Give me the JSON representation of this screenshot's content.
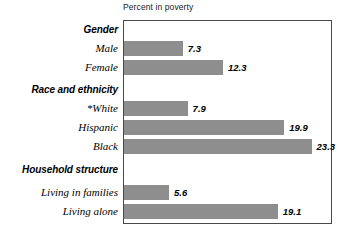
{
  "chart": {
    "title": "Percent in poverty"
  },
  "chart_data": {
    "type": "bar",
    "orientation": "horizontal",
    "title": "Percent in poverty",
    "xlabel": "Percent in poverty",
    "ylabel": "",
    "xlim": [
      0,
      25.7
    ],
    "grid": false,
    "legend": null,
    "bar_color": "#8e8e8e",
    "frame_color": "#4a4a4a",
    "groups": [
      {
        "heading": "Gender",
        "items": [
          {
            "category": "Male",
            "value": 7.3,
            "label": "7.3"
          },
          {
            "category": "Female",
            "value": 12.3,
            "label": "12.3"
          }
        ]
      },
      {
        "heading": "Race and ethnicity",
        "items": [
          {
            "category": "*White",
            "value": 7.9,
            "label": "7.9"
          },
          {
            "category": "Hispanic",
            "value": 19.9,
            "label": "19.9"
          },
          {
            "category": "Black",
            "value": 23.3,
            "label": "23.3"
          }
        ]
      },
      {
        "heading": "Household structure",
        "items": [
          {
            "category": "Living in families",
            "value": 5.6,
            "label": "5.6"
          },
          {
            "category": "Living alone",
            "value": 19.1,
            "label": "19.1"
          }
        ]
      }
    ],
    "categories": [
      "Male",
      "Female",
      "*White",
      "Hispanic",
      "Black",
      "Living in families",
      "Living alone"
    ],
    "values": [
      7.3,
      12.3,
      7.9,
      19.9,
      23.3,
      5.6,
      19.1
    ]
  },
  "rows": [
    {
      "kind": "group",
      "text": "Gender",
      "top": 20
    },
    {
      "kind": "bar",
      "text": "Male",
      "top": 38,
      "value": 7.3,
      "label": "7.3"
    },
    {
      "kind": "bar",
      "text": "Female",
      "top": 57,
      "value": 12.3,
      "label": "12.3"
    },
    {
      "kind": "group",
      "text": "Race and ethnicity",
      "top": 80
    },
    {
      "kind": "bar",
      "text": "*White",
      "top": 98,
      "value": 7.9,
      "label": "7.9"
    },
    {
      "kind": "bar",
      "text": "Hispanic",
      "top": 117,
      "value": 19.9,
      "label": "19.9"
    },
    {
      "kind": "bar",
      "text": "Black",
      "top": 136,
      "value": 23.3,
      "label": "23.3"
    },
    {
      "kind": "group",
      "text": "Household structure",
      "top": 160
    },
    {
      "kind": "bar",
      "text": "Living in families",
      "top": 182,
      "value": 5.6,
      "label": "5.6"
    },
    {
      "kind": "bar",
      "text": "Living alone",
      "top": 201,
      "value": 19.1,
      "label": "19.1"
    }
  ]
}
